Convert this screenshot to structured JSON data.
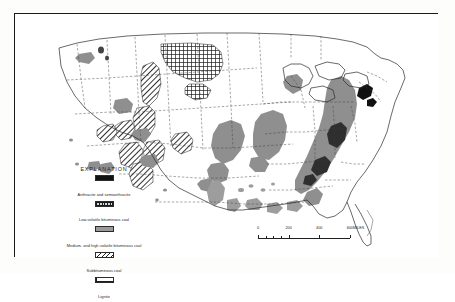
{
  "figure": {
    "kind": "map",
    "background_color": "#fdfdfc",
    "frame_color": "#1a1a1a"
  },
  "legend": {
    "title": "EXPLANATION",
    "entries": [
      {
        "pattern": "solid-black",
        "label": "Anthracite and semianthracite",
        "color": "#111111"
      },
      {
        "pattern": "fine-grid",
        "label": "Low-volatile bituminous coal",
        "color": "#d7d7d7"
      },
      {
        "pattern": "solid-gray",
        "label": "Medium- and high-volatile bituminous coal",
        "color": "#9a9a9a"
      },
      {
        "pattern": "diagonal-hatch",
        "label": "Subbituminous coal",
        "color": "#ffffff"
      },
      {
        "pattern": "open-crosshatch",
        "label": "Lignite",
        "color": "#ffffff"
      }
    ]
  },
  "scale": {
    "ticks": [
      {
        "value": "0",
        "position_pct": 0
      },
      {
        "value": "200",
        "position_pct": 33.3
      },
      {
        "value": "400",
        "position_pct": 66.6
      },
      {
        "value": "600",
        "position_pct": 100
      }
    ],
    "units": "MILES"
  },
  "map_regions": [
    {
      "name": "north-dakota-lignite",
      "pattern": "open-crosshatch"
    },
    {
      "name": "montana-wyoming-subbituminous",
      "pattern": "diagonal-hatch"
    },
    {
      "name": "four-corners-subbituminous",
      "pattern": "diagonal-hatch"
    },
    {
      "name": "illinois-basin-bituminous",
      "pattern": "solid-gray"
    },
    {
      "name": "appalachian-basin-bituminous",
      "pattern": "solid-gray"
    },
    {
      "name": "pennsylvania-anthracite",
      "pattern": "solid-black"
    },
    {
      "name": "west-virginia-low-volatile",
      "pattern": "solid-black"
    },
    {
      "name": "michigan-basin-bituminous",
      "pattern": "solid-gray"
    },
    {
      "name": "western-interior-bituminous",
      "pattern": "solid-gray"
    },
    {
      "name": "gulf-coast-lignite",
      "pattern": "solid-gray"
    }
  ]
}
